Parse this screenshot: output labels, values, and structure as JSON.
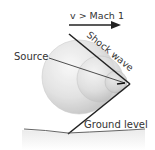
{
  "diagram": {
    "type": "physics-illustration",
    "labels": {
      "velocity": "v > Mach 1",
      "shock_wave": "Shock wave",
      "source": "Source",
      "ground": "Ground level"
    },
    "colors": {
      "line": "#222222",
      "text": "#333333",
      "sphere_fill": "#d8d8d8",
      "sphere_edge": "#c4c4c4",
      "ground": "#555555",
      "background": "#ffffff"
    },
    "spheres": [
      {
        "name": "largest-wavefront",
        "cx": 79,
        "cy": 77,
        "r": 37
      },
      {
        "name": "middle-wavefront",
        "cx": 100,
        "cy": 79,
        "r": 23
      },
      {
        "name": "smallest-wavefront",
        "cx": 116,
        "cy": 82,
        "r": 11
      }
    ],
    "apex": {
      "x": 130,
      "y": 84
    }
  }
}
